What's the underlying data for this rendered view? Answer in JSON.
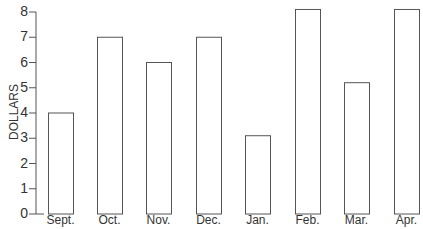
{
  "chart_data": {
    "type": "bar",
    "title": "",
    "xlabel": "",
    "ylabel": "DOLLARS",
    "categories": [
      "Sept.",
      "Oct.",
      "Nov.",
      "Dec.",
      "Jan.",
      "Feb.",
      "Mar.",
      "Apr."
    ],
    "values": [
      4,
      7,
      6,
      7,
      3.1,
      8.1,
      5.2,
      8.1
    ],
    "ylim": [
      0,
      8
    ],
    "yticks": [
      "0",
      "1",
      "2",
      "3",
      "4",
      "5",
      "6",
      "7",
      "8"
    ],
    "grid": false,
    "legend": null,
    "bar_fill": "#ffffff",
    "bar_stroke": "#555555"
  }
}
